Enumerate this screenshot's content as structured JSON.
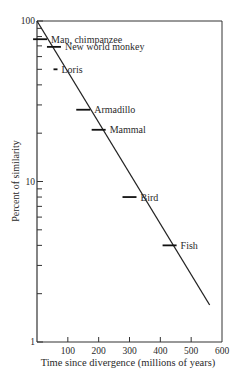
{
  "chart_data": {
    "type": "line",
    "title": "",
    "xlabel": "Time since divergence (millions of years)",
    "ylabel": "Percent of similarity",
    "xlim": [
      0,
      600
    ],
    "ylim": [
      1,
      100
    ],
    "yscale": "log",
    "x_ticks": [
      100,
      200,
      300,
      400,
      500,
      600
    ],
    "x_tick_labels": [
      "100",
      "200",
      "300",
      "400",
      "500",
      "600"
    ],
    "y_tick_labels": [
      {
        "value": 100,
        "label": "100"
      },
      {
        "value": 10,
        "label": "10"
      },
      {
        "value": 1,
        "label": "1"
      }
    ],
    "y_minor_ticks": [
      2,
      3,
      4,
      5,
      6,
      7,
      8,
      9,
      20,
      30,
      40,
      50,
      60,
      70,
      80,
      90
    ],
    "grid": false,
    "legend": "none",
    "trend_line": {
      "x": [
        0,
        560
      ],
      "y": [
        100,
        1.7
      ]
    },
    "points": [
      {
        "label": "Man, chimpanzee",
        "x": 10,
        "y": 77
      },
      {
        "label": "New world monkey",
        "x": 55,
        "y": 69
      },
      {
        "label": "Loris",
        "x": 60,
        "y": 50
      },
      {
        "label": "Armadillo",
        "x": 150,
        "y": 28
      },
      {
        "label": "Mammal",
        "x": 200,
        "y": 21
      },
      {
        "label": "Bird",
        "x": 300,
        "y": 8
      },
      {
        "label": "Fish",
        "x": 430,
        "y": 4
      }
    ]
  }
}
